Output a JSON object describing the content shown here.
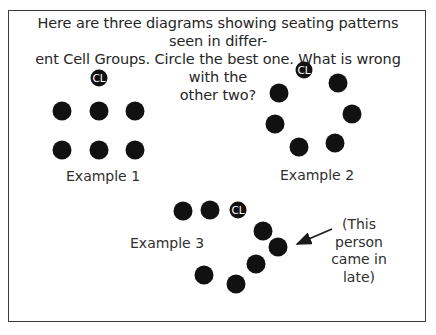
{
  "prompt": {
    "line1": "Here are three diagrams showing seating patterns seen in differ-",
    "line2": "ent Cell Groups. Circle the best one. What is wrong with the",
    "line3": "other two?"
  },
  "colors": {
    "seat": "#111111",
    "leader_text": "#ffffff",
    "border": "#3a3a3a"
  },
  "leader_label": "CL",
  "examples": [
    {
      "label": "Example 1",
      "leader": [
        99,
        78
      ],
      "seats": [
        [
          62,
          111
        ],
        [
          99,
          111
        ],
        [
          135,
          111
        ],
        [
          62,
          150
        ],
        [
          99,
          150
        ],
        [
          135,
          150
        ]
      ]
    },
    {
      "label": "Example 2",
      "leader": [
        304,
        70
      ],
      "seats": [
        [
          338,
          83
        ],
        [
          279,
          93
        ],
        [
          352,
          114
        ],
        [
          275,
          124
        ],
        [
          299,
          147
        ],
        [
          335,
          143
        ]
      ]
    },
    {
      "label": "Example 3",
      "leader": [
        238,
        210
      ],
      "seats": [
        [
          183,
          211
        ],
        [
          210,
          210
        ],
        [
          263,
          231
        ],
        [
          278,
          247
        ],
        [
          256,
          264
        ],
        [
          204,
          275
        ],
        [
          236,
          284
        ]
      ]
    }
  ],
  "annotation": {
    "lines": [
      "(This",
      "person",
      "came in",
      "late)"
    ],
    "arrow_from": [
      332,
      229
    ],
    "arrow_to": [
      297,
      244
    ]
  }
}
